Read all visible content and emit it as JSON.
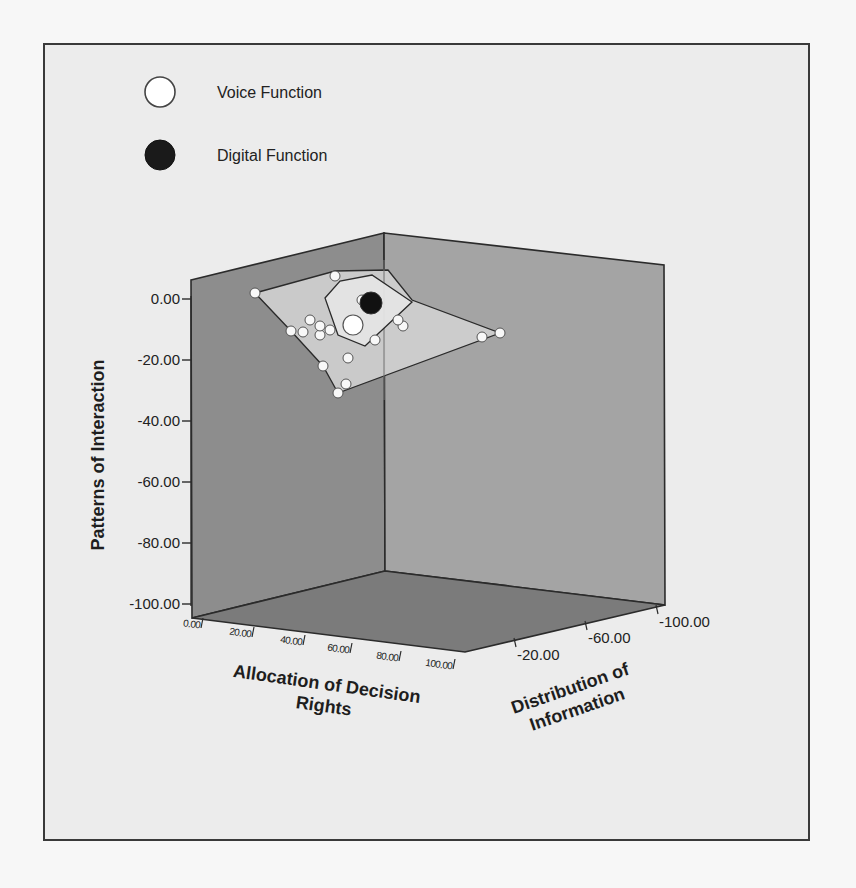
{
  "chart_data": {
    "type": "scatter",
    "subtype": "3d-scatter-with-convex-hulls",
    "title": "",
    "legend": {
      "position": "top-left",
      "entries": [
        {
          "label": "Voice Function",
          "marker": "open-white-circle",
          "color": "#ffffff"
        },
        {
          "label": "Digital Function",
          "marker": "filled-black-circle",
          "color": "#1a1a1a"
        }
      ]
    },
    "axes": {
      "x": {
        "label": "Allocation of Decision Rights",
        "ticks": [
          "0.00",
          "20.00",
          "40.00",
          "60.00",
          "80.00",
          "100.00"
        ],
        "range": [
          0,
          100
        ]
      },
      "y": {
        "label": "Patterns of Interaction",
        "ticks": [
          "0.00",
          "-20.00",
          "-40.00",
          "-60.00",
          "-80.00",
          "-100.00"
        ],
        "range": [
          -100,
          0
        ]
      },
      "z": {
        "label": "Distribution of Information",
        "ticks": [
          "-20.00",
          "-60.00",
          "-100.00"
        ],
        "range": [
          -100,
          0
        ]
      }
    },
    "grid": false,
    "series": [
      {
        "name": "Voice Function",
        "centroid_marker": "large-white-circle",
        "hull": "outer",
        "note": "approx. 20 cases, patterns of interaction roughly 0 to -25"
      },
      {
        "name": "Digital Function",
        "centroid_marker": "large-black-circle",
        "hull": "inner",
        "note": "cluster near top, patterns of interaction approx -5"
      }
    ]
  },
  "legend": {
    "voice_label": "Voice Function",
    "digital_label": "Digital Function"
  },
  "axis_titles": {
    "y": "Patterns of Interaction",
    "x_line1": "Allocation of Decision",
    "x_line2": "Rights",
    "z_line1": "Distribution of",
    "z_line2": "Information"
  },
  "y_ticks": [
    {
      "label": "0.00",
      "y": 299
    },
    {
      "label": "-20.00",
      "y": 360
    },
    {
      "label": "-40.00",
      "y": 421
    },
    {
      "label": "-60.00",
      "y": 482
    },
    {
      "label": "-80.00",
      "y": 543
    },
    {
      "label": "-100.00",
      "y": 604
    }
  ],
  "x_ticks": [
    {
      "label": "0.00",
      "x": 203,
      "y": 627
    },
    {
      "label": "20.00",
      "x": 254,
      "y": 636
    },
    {
      "label": "40.00",
      "x": 305,
      "y": 644
    },
    {
      "label": "60.00",
      "x": 352,
      "y": 652
    },
    {
      "label": "80.00",
      "x": 401,
      "y": 660
    },
    {
      "label": "100.00",
      "x": 455,
      "y": 668
    }
  ],
  "z_ticks": [
    {
      "label": "-20.00",
      "x": 516,
      "y": 650
    },
    {
      "label": "-60.00",
      "x": 587,
      "y": 633
    },
    {
      "label": "-100.00",
      "x": 658,
      "y": 617
    }
  ],
  "colors": {
    "left_wall": "#8d8d8d",
    "right_wall": "#a4a4a4",
    "floor": "#7b7b7b",
    "edge": "#2b2b2b",
    "outer_hull_fill": "#cfcfcf",
    "inner_hull_fill": "#e2e2e2"
  },
  "points": {
    "voice": [
      [
        255,
        293
      ],
      [
        335,
        276
      ],
      [
        291,
        331
      ],
      [
        303,
        332
      ],
      [
        320,
        335
      ],
      [
        320,
        326
      ],
      [
        330,
        330
      ],
      [
        403,
        326
      ],
      [
        348,
        358
      ],
      [
        323,
        366
      ],
      [
        346,
        384
      ],
      [
        338,
        393
      ],
      [
        482,
        337
      ],
      [
        500,
        333
      ],
      [
        362,
        300
      ],
      [
        375,
        340
      ],
      [
        398,
        320
      ],
      [
        310,
        320
      ]
    ],
    "voice_centroid": [
      353,
      325
    ],
    "digital_centroid": [
      371,
      303
    ]
  },
  "hulls": {
    "outer": [
      [
        255,
        293
      ],
      [
        335,
        271
      ],
      [
        388,
        270
      ],
      [
        412,
        300
      ],
      [
        500,
        333
      ],
      [
        338,
        393
      ],
      [
        323,
        366
      ],
      [
        291,
        331
      ]
    ],
    "inner": [
      [
        325,
        298
      ],
      [
        340,
        281
      ],
      [
        372,
        275
      ],
      [
        412,
        302
      ],
      [
        365,
        346
      ],
      [
        338,
        335
      ]
    ]
  }
}
